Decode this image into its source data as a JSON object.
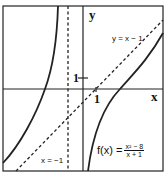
{
  "graph": {
    "function": "f(x) = (x^2 - 8)/(x + 1)",
    "axes": {
      "x_label": "x",
      "y_label": "y"
    },
    "ticks": {
      "x_tick": "1",
      "y_tick": "1"
    },
    "asymptotes": {
      "vertical": {
        "label": "x = −1",
        "x": -1
      },
      "oblique": {
        "label": "y = x − 1",
        "slope": 1,
        "intercept": -1
      }
    },
    "formula": {
      "lhs": "f(x) =",
      "numerator": "x² − 8",
      "denominator": "x + 1"
    },
    "colors": {
      "curve": "#111111",
      "background": "#ffffff"
    }
  }
}
